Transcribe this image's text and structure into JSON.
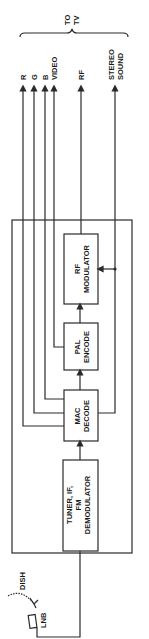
{
  "diagram": {
    "output_group_label": [
      "TO",
      "TV"
    ],
    "outputs": [
      {
        "label": "R"
      },
      {
        "label": "G"
      },
      {
        "label": "B"
      },
      {
        "label": "VIDEO"
      },
      {
        "label": "RF"
      },
      {
        "label": [
          "STEREO",
          "SOUND"
        ]
      }
    ],
    "blocks": [
      {
        "id": "tuner",
        "label": [
          "TUNER, IF,",
          "FM",
          "DEMODULATOR"
        ]
      },
      {
        "id": "mac",
        "label": [
          "MAC",
          "DECODE"
        ]
      },
      {
        "id": "pal",
        "label": [
          "PAL",
          "ENCODE"
        ]
      },
      {
        "id": "rfmod",
        "label": [
          "RF",
          "MODULATOR"
        ]
      }
    ],
    "inputs": {
      "dish_label": "DISH",
      "lnb_label": "LNB"
    },
    "line_color": "#2a2a2a"
  }
}
